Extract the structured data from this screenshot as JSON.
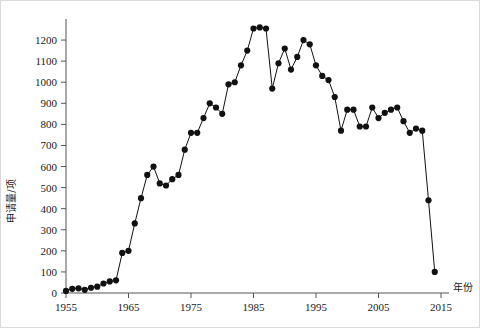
{
  "chart_data": {
    "type": "line",
    "title": "",
    "subtitle": "",
    "xlabel": "年份",
    "ylabel": "申请量/项",
    "xlim": [
      1955,
      2015
    ],
    "ylim": [
      0,
      1300
    ],
    "xticks": [
      1955,
      1965,
      1975,
      1985,
      1995,
      2005,
      2015
    ],
    "xtick_labels": [
      "1955",
      "1965",
      "1975",
      "1985",
      "1995",
      "2005",
      "2015"
    ],
    "yticks": [
      0,
      100,
      200,
      300,
      400,
      500,
      600,
      700,
      800,
      900,
      1000,
      1100,
      1200
    ],
    "ytick_labels": [
      "0",
      "100",
      "200",
      "300",
      "400",
      "500",
      "600",
      "700",
      "800",
      "900",
      "1000",
      "1100",
      "1200"
    ],
    "grid": false,
    "legend": null,
    "marker": "filled-circle",
    "marker_color": "#111111",
    "line_color": "#111111",
    "axis_color": "#555555",
    "background_color": "#ffffff",
    "series": [
      {
        "name": "申请量",
        "x": [
          1955,
          1956,
          1957,
          1958,
          1959,
          1960,
          1961,
          1962,
          1963,
          1964,
          1965,
          1966,
          1967,
          1968,
          1969,
          1970,
          1971,
          1972,
          1973,
          1974,
          1975,
          1976,
          1977,
          1978,
          1979,
          1980,
          1981,
          1982,
          1983,
          1984,
          1985,
          1986,
          1987,
          1988,
          1989,
          1990,
          1991,
          1992,
          1993,
          1994,
          1995,
          1996,
          1997,
          1998,
          1999,
          2000,
          2001,
          2002,
          2003,
          2004,
          2005,
          2006,
          2007,
          2008,
          2009,
          2010,
          2011,
          2012,
          2013,
          2014
        ],
        "values": [
          10,
          20,
          22,
          15,
          25,
          30,
          45,
          55,
          60,
          190,
          200,
          330,
          450,
          560,
          600,
          520,
          510,
          540,
          560,
          680,
          760,
          760,
          830,
          900,
          880,
          850,
          990,
          1000,
          1080,
          1150,
          1255,
          1260,
          1255,
          970,
          1090,
          1160,
          1060,
          1120,
          1200,
          1180,
          1080,
          1030,
          1010,
          930,
          770,
          870,
          870,
          790,
          790,
          880,
          830,
          855,
          870,
          880,
          815,
          760,
          780,
          770,
          440,
          100
        ]
      }
    ]
  },
  "axis": {
    "y_label_text": "申请量/项",
    "x_label_text": "年份"
  }
}
